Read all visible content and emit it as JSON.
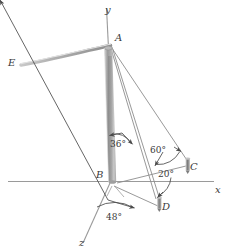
{
  "figure": {
    "background_color": "#ffffff",
    "line_color": "#8a8a8a",
    "text_color": "#3a3a3a",
    "pole_color": "#9a9a9a"
  },
  "axes": [
    {
      "key": "y",
      "label": "y",
      "description": "vertical axis upward through top of pole"
    },
    {
      "key": "x",
      "label": "x",
      "description": "horizontal ground axis to the right"
    },
    {
      "key": "z",
      "label": "z",
      "description": "axis toward viewer, lower left"
    }
  ],
  "points": [
    {
      "key": "A",
      "label": "A",
      "description": "top of pole"
    },
    {
      "key": "B",
      "label": "B",
      "description": "base of pole at origin"
    },
    {
      "key": "C",
      "label": "C",
      "description": "anchor stake on x axis"
    },
    {
      "key": "D",
      "label": "D",
      "description": "anchor stake below x axis"
    },
    {
      "key": "E",
      "label": "E",
      "description": "far end of sagging cable"
    }
  ],
  "angles": [
    {
      "key": "a36",
      "label": "36°",
      "value": 36,
      "unit": "deg",
      "description": "angle between pole and cable AD"
    },
    {
      "key": "a60",
      "label": "60°",
      "value": 60,
      "unit": "deg",
      "description": "angle at C between ground and cable AC"
    },
    {
      "key": "a20",
      "label": "20°",
      "value": 20,
      "unit": "deg",
      "description": "angle at C between x axis and BC"
    },
    {
      "key": "a48",
      "label": "48°",
      "value": 48,
      "unit": "deg",
      "description": "angle at B between z axis and BD"
    }
  ],
  "members": [
    {
      "key": "pole",
      "from": "B",
      "to": "A",
      "type": "pole"
    },
    {
      "key": "cable_AE",
      "from": "A",
      "to": "E",
      "type": "sagging-cable"
    },
    {
      "key": "cable_AC",
      "from": "A",
      "to": "C",
      "type": "guy-wire"
    },
    {
      "key": "cable_AD",
      "from": "A",
      "to": "D",
      "type": "guy-wire"
    },
    {
      "key": "line_BC",
      "from": "B",
      "to": "C",
      "type": "ground-projection"
    },
    {
      "key": "line_BD",
      "from": "B",
      "to": "D",
      "type": "ground-projection"
    }
  ]
}
